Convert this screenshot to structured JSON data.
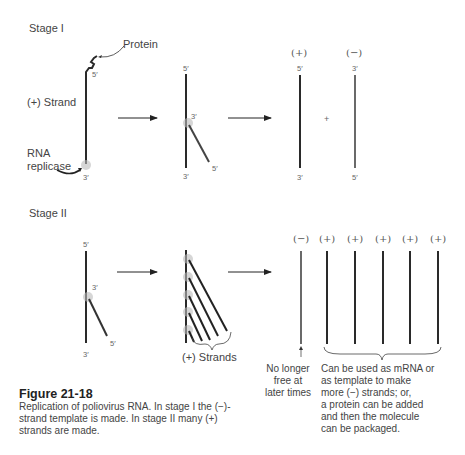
{
  "stage1": {
    "title": "Stage I",
    "protein_label": "Protein",
    "plus_strand_label": "(+) Strand",
    "replicase_label_line1": "RNA",
    "replicase_label_line2": "replicase",
    "end5": "5′",
    "end3": "3′",
    "plus_sign": "(+)",
    "minus_sign": "(−)",
    "combine": "+"
  },
  "stage2": {
    "title": "Stage II",
    "end5": "5′",
    "end3": "3′",
    "strands_label": "(+) Strands",
    "products": [
      "(−)",
      "(+)",
      "(+)",
      "(+)",
      "(+)",
      "(+)"
    ],
    "minus_note": [
      "No longer",
      "free at",
      "later times"
    ],
    "plus_note": [
      "Can be used as mRNA or",
      "as template to make",
      "more (−) strands; or,",
      "a protein can be added",
      "and then the molecule",
      "can be packaged."
    ]
  },
  "caption": {
    "title": "Figure 21-18",
    "body": "Replication of poliovirus RNA. In stage I the (−)-strand template is made. In stage II many (+) strands are made."
  },
  "colors": {
    "strand": "#2a2a2a",
    "replicase": "#bbbbbb",
    "text": "#444444"
  }
}
